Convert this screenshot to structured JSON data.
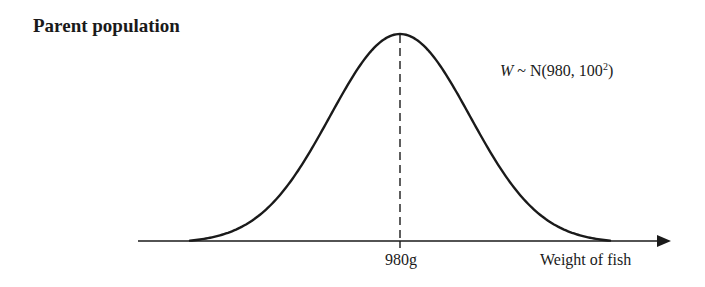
{
  "title": "Parent population",
  "formula": {
    "variable": "W",
    "tilde": " ~ ",
    "dist": "N(980, 100",
    "exponent": "2",
    "close": ")"
  },
  "axis": {
    "tick_label": "980g",
    "xlabel": "Weight of fish"
  },
  "colors": {
    "ink": "#1a1a1a",
    "background": "#ffffff"
  },
  "chart_data": {
    "type": "line",
    "title": "Parent population",
    "distribution": {
      "name": "normal",
      "mean": 980,
      "sd": 100,
      "variance": 10000
    },
    "annotation": "W ~ N(980, 100²)",
    "xlabel": "Weight of fish",
    "ylabel": "",
    "x_ticks": [
      "980g"
    ],
    "mean_marker": {
      "x": 980,
      "style": "dashed"
    },
    "grid": false,
    "legend": false
  }
}
